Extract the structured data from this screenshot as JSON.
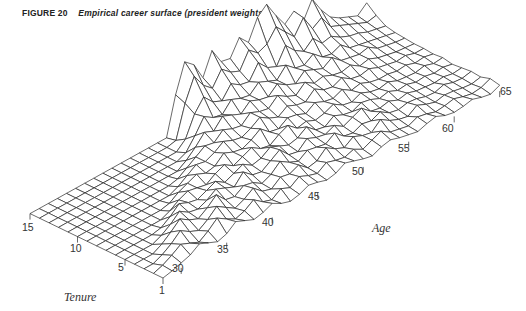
{
  "caption": {
    "figure_label": "FIGURE 20",
    "title": "Empirical career surface (president weights)"
  },
  "chart_data": {
    "type": "surface",
    "title": "Empirical career surface (president weights)",
    "figure_label": "FIGURE 20",
    "xlabel": "Age",
    "ylabel": "Tenure",
    "zlabel": "",
    "x_ticks": [
      30,
      35,
      40,
      45,
      50,
      55,
      60,
      65
    ],
    "y_ticks": [
      1,
      5,
      10,
      15
    ],
    "x_range": [
      28,
      65
    ],
    "y_range": [
      1,
      15
    ],
    "grid": true,
    "ages": [
      28,
      29,
      30,
      31,
      32,
      33,
      34,
      35,
      36,
      37,
      38,
      39,
      40,
      41,
      42,
      43,
      44,
      45,
      46,
      47,
      48,
      49,
      50,
      51,
      52,
      53,
      54,
      55,
      56,
      57,
      58,
      59,
      60,
      61,
      62,
      63,
      64,
      65
    ],
    "tenures": [
      1,
      2,
      3,
      4,
      5,
      6,
      7,
      8,
      9,
      10,
      11,
      12,
      13,
      14,
      15
    ],
    "heights_px": [
      [
        0,
        2,
        5,
        8,
        14,
        10,
        6,
        9,
        16,
        12,
        8,
        10,
        14,
        9,
        6,
        8,
        12,
        10,
        7,
        9,
        14,
        11,
        8,
        6,
        10,
        12,
        9,
        7,
        5,
        8,
        10,
        6,
        4,
        5,
        7,
        4,
        2,
        6
      ],
      [
        0,
        3,
        8,
        14,
        10,
        6,
        12,
        20,
        14,
        9,
        12,
        18,
        11,
        8,
        14,
        10,
        16,
        12,
        9,
        15,
        12,
        10,
        13,
        8,
        12,
        16,
        10,
        8,
        6,
        10,
        8,
        5,
        6,
        8,
        5,
        3,
        4,
        8
      ],
      [
        0,
        0,
        4,
        10,
        18,
        12,
        8,
        14,
        22,
        16,
        10,
        14,
        20,
        12,
        9,
        16,
        14,
        18,
        10,
        12,
        20,
        14,
        10,
        16,
        12,
        10,
        18,
        12,
        8,
        6,
        12,
        8,
        5,
        7,
        6,
        4,
        3,
        5
      ],
      [
        0,
        0,
        0,
        5,
        12,
        20,
        14,
        10,
        16,
        24,
        14,
        12,
        18,
        16,
        10,
        14,
        22,
        16,
        12,
        18,
        16,
        14,
        20,
        12,
        10,
        14,
        12,
        16,
        10,
        8,
        10,
        9,
        6,
        5,
        8,
        5,
        4,
        6
      ],
      [
        0,
        0,
        0,
        0,
        4,
        10,
        18,
        12,
        10,
        14,
        20,
        16,
        12,
        22,
        14,
        12,
        18,
        24,
        14,
        12,
        20,
        16,
        14,
        18,
        12,
        16,
        20,
        12,
        10,
        12,
        8,
        10,
        7,
        6,
        5,
        6,
        4,
        5
      ],
      [
        0,
        0,
        0,
        0,
        0,
        2,
        8,
        16,
        12,
        10,
        14,
        18,
        12,
        16,
        20,
        14,
        16,
        22,
        18,
        14,
        16,
        22,
        14,
        12,
        18,
        14,
        12,
        16,
        14,
        10,
        12,
        8,
        9,
        6,
        7,
        5,
        6,
        4
      ],
      [
        0,
        0,
        0,
        0,
        0,
        0,
        0,
        4,
        10,
        14,
        12,
        10,
        16,
        20,
        14,
        18,
        22,
        16,
        14,
        20,
        24,
        16,
        18,
        14,
        16,
        20,
        14,
        12,
        16,
        12,
        10,
        12,
        8,
        7,
        6,
        8,
        5,
        6
      ],
      [
        0,
        0,
        0,
        0,
        0,
        0,
        0,
        0,
        2,
        8,
        12,
        16,
        12,
        14,
        22,
        18,
        16,
        20,
        26,
        18,
        16,
        22,
        20,
        16,
        22,
        18,
        16,
        20,
        14,
        16,
        12,
        10,
        10,
        8,
        9,
        6,
        7,
        5
      ],
      [
        0,
        0,
        0,
        0,
        0,
        0,
        0,
        0,
        0,
        0,
        4,
        10,
        16,
        14,
        18,
        24,
        20,
        18,
        22,
        28,
        22,
        18,
        24,
        20,
        18,
        26,
        20,
        18,
        22,
        16,
        14,
        16,
        12,
        10,
        8,
        9,
        6,
        6
      ],
      [
        0,
        0,
        0,
        0,
        0,
        0,
        0,
        0,
        0,
        0,
        0,
        2,
        8,
        14,
        20,
        18,
        26,
        22,
        20,
        28,
        24,
        22,
        30,
        24,
        20,
        28,
        22,
        24,
        20,
        18,
        20,
        14,
        16,
        12,
        10,
        8,
        7,
        6
      ],
      [
        0,
        0,
        0,
        0,
        0,
        0,
        0,
        0,
        0,
        0,
        0,
        0,
        0,
        6,
        14,
        24,
        20,
        30,
        26,
        22,
        30,
        26,
        24,
        32,
        26,
        22,
        30,
        26,
        22,
        28,
        20,
        18,
        16,
        18,
        12,
        10,
        8,
        7
      ],
      [
        0,
        0,
        0,
        0,
        0,
        0,
        0,
        0,
        0,
        0,
        0,
        0,
        0,
        0,
        4,
        16,
        30,
        24,
        22,
        32,
        28,
        26,
        34,
        30,
        26,
        36,
        28,
        26,
        32,
        24,
        22,
        26,
        18,
        16,
        14,
        12,
        10,
        8
      ],
      [
        0,
        0,
        0,
        0,
        0,
        0,
        0,
        0,
        0,
        0,
        0,
        0,
        0,
        0,
        0,
        8,
        28,
        40,
        30,
        26,
        38,
        32,
        30,
        44,
        34,
        30,
        46,
        36,
        30,
        38,
        28,
        30,
        24,
        20,
        18,
        14,
        12,
        10
      ],
      [
        0,
        0,
        0,
        0,
        0,
        0,
        0,
        0,
        0,
        0,
        0,
        0,
        0,
        0,
        0,
        2,
        34,
        56,
        42,
        34,
        48,
        40,
        36,
        52,
        44,
        48,
        60,
        50,
        40,
        54,
        38,
        44,
        30,
        26,
        22,
        18,
        14,
        16
      ],
      [
        0,
        0,
        0,
        0,
        0,
        0,
        0,
        0,
        0,
        0,
        0,
        0,
        0,
        0,
        0,
        0,
        38,
        66,
        58,
        40,
        62,
        46,
        44,
        60,
        50,
        70,
        78,
        62,
        48,
        56,
        40,
        58,
        42,
        30,
        24,
        20,
        16,
        24
      ]
    ],
    "projection": {
      "origin_px": [
        163,
        278
      ],
      "age_step_px": [
        9.1,
        -5.05
      ],
      "tenure_step_px": [
        -9.5,
        -4.6
      ],
      "first_age": 28
    }
  },
  "axes": {
    "age_label": "Age",
    "tenure_label": "Tenure",
    "age_ticks": [
      {
        "label": "30",
        "x": 172,
        "y": 262
      },
      {
        "label": "35",
        "x": 217,
        "y": 243
      },
      {
        "label": "40",
        "x": 262,
        "y": 216
      },
      {
        "label": "45",
        "x": 308,
        "y": 190
      },
      {
        "label": "50",
        "x": 352,
        "y": 165
      },
      {
        "label": "55",
        "x": 398,
        "y": 142
      },
      {
        "label": "60",
        "x": 442,
        "y": 122
      },
      {
        "label": "65",
        "x": 500,
        "y": 85
      }
    ],
    "tenure_ticks": [
      {
        "label": "1",
        "x": 159,
        "y": 284
      },
      {
        "label": "5",
        "x": 118,
        "y": 261
      },
      {
        "label": "10",
        "x": 70,
        "y": 242
      },
      {
        "label": "15",
        "x": 22,
        "y": 221
      }
    ]
  }
}
